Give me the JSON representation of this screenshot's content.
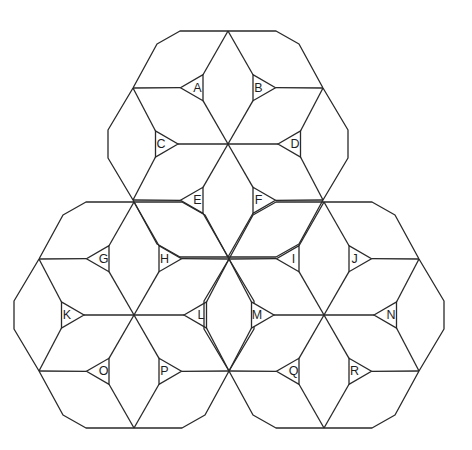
{
  "diagram": {
    "stroke_color": "#2a2a2a",
    "background": "#ffffff",
    "rosettes": [
      {
        "name": "top-rosette",
        "center": [
          228,
          144
        ],
        "triangles": [
          {
            "label": "A",
            "angle": 120
          },
          {
            "label": "B",
            "angle": 60
          },
          {
            "label": "C",
            "angle": 180
          },
          {
            "label": "D",
            "angle": 0
          },
          {
            "label": "E",
            "angle": 240
          },
          {
            "label": "F",
            "angle": 300
          }
        ]
      },
      {
        "name": "bottom-left-rosette",
        "center": [
          134,
          315
        ],
        "triangles": [
          {
            "label": "G",
            "angle": 120
          },
          {
            "label": "H",
            "angle": 60
          },
          {
            "label": "K",
            "angle": 180
          },
          {
            "label": "L",
            "angle": 0
          },
          {
            "label": "O",
            "angle": 240
          },
          {
            "label": "P",
            "angle": 300
          }
        ]
      },
      {
        "name": "bottom-right-rosette",
        "center": [
          324,
          315
        ],
        "triangles": [
          {
            "label": "I",
            "angle": 120
          },
          {
            "label": "J",
            "angle": 60
          },
          {
            "label": "M",
            "angle": 180
          },
          {
            "label": "N",
            "angle": 0
          },
          {
            "label": "Q",
            "angle": 240
          },
          {
            "label": "R",
            "angle": 300
          }
        ]
      }
    ],
    "labels": [
      "A",
      "B",
      "C",
      "D",
      "E",
      "F",
      "G",
      "H",
      "I",
      "J",
      "K",
      "L",
      "M",
      "N",
      "O",
      "P",
      "Q",
      "R"
    ]
  }
}
